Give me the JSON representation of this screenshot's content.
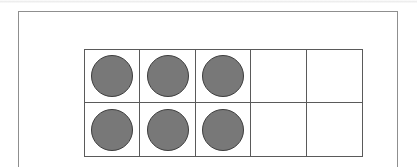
{
  "figure": {
    "type": "ten-frame",
    "title": "Ten frame",
    "description": "A two-by-five ten frame with six grey round counters filling the first three columns of both rows.",
    "filled_count": "6",
    "total_cells": "10",
    "empty_count": "4"
  },
  "colors": {
    "page_background": "#ffffff",
    "page_frame_line": "#8f8f8f",
    "grid_line": "#5a5a5a",
    "counter_fill": "#787878",
    "counter_outline": "#3d3d3d"
  },
  "grid": {
    "columns": "5",
    "rows": "2",
    "rows_data": [
      {
        "row_label": "top-row",
        "cells": [
          {
            "index": "1",
            "state": "filled"
          },
          {
            "index": "2",
            "state": "filled"
          },
          {
            "index": "3",
            "state": "filled"
          },
          {
            "index": "4",
            "state": "empty"
          },
          {
            "index": "5",
            "state": "empty"
          }
        ]
      },
      {
        "row_label": "bottom-row",
        "cells": [
          {
            "index": "6",
            "state": "filled"
          },
          {
            "index": "7",
            "state": "filled"
          },
          {
            "index": "8",
            "state": "filled"
          },
          {
            "index": "9",
            "state": "empty"
          },
          {
            "index": "10",
            "state": "empty"
          }
        ]
      }
    ]
  }
}
